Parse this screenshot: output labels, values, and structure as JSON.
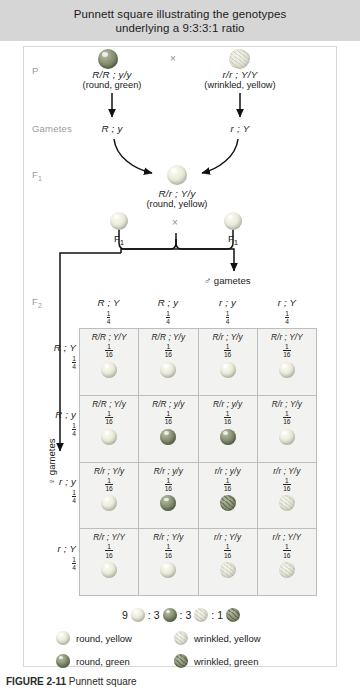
{
  "header": {
    "line1": "Punnett square illustrating the genotypes",
    "line2": "underlying a 9:3:3:1 ratio"
  },
  "generations": {
    "p_label": "P",
    "gametes_label": "Gametes",
    "f1_label": "F",
    "f1_sub": "1",
    "f2_label": "F",
    "f2_sub": "2"
  },
  "parents": {
    "left": {
      "genotype": "R/R ; y/y",
      "phenotype": "(round, green)",
      "gamete": "R ; y",
      "pea": "round-green"
    },
    "right": {
      "genotype": "r/r ; Y/Y",
      "phenotype": "(wrinkled, yellow)",
      "gamete": "r ; Y",
      "pea": "wrinkled-yellow"
    },
    "cross_symbol": "×"
  },
  "f1": {
    "genotype": "R/r ; Y/y",
    "phenotype": "(round, yellow)",
    "pea": "round-yellow",
    "left_label": "F",
    "left_sub": "1",
    "right_label": "F",
    "right_sub": "1",
    "cross_symbol": "×"
  },
  "punnett": {
    "male_gametes_label": "♂ gametes",
    "female_gametes_label": "♀ gametes",
    "columns": [
      {
        "gamete": "R ; Y",
        "freq_n": "1",
        "freq_d": "4"
      },
      {
        "gamete": "R ; y",
        "freq_n": "1",
        "freq_d": "4"
      },
      {
        "gamete": "r ; y",
        "freq_n": "1",
        "freq_d": "4"
      },
      {
        "gamete": "r ; Y",
        "freq_n": "1",
        "freq_d": "4"
      }
    ],
    "rows": [
      {
        "gamete": "R ; Y",
        "freq_n": "1",
        "freq_d": "4"
      },
      {
        "gamete": "R ; y",
        "freq_n": "1",
        "freq_d": "4"
      },
      {
        "gamete": "r ; y",
        "freq_n": "1",
        "freq_d": "4"
      },
      {
        "gamete": "r ; Y",
        "freq_n": "1",
        "freq_d": "4"
      }
    ],
    "cells": [
      {
        "genotype": "R/R ; Y/Y",
        "freq_n": "1",
        "freq_d": "16",
        "pea": "round-yellow"
      },
      {
        "genotype": "R/R ; Y/y",
        "freq_n": "1",
        "freq_d": "16",
        "pea": "round-yellow"
      },
      {
        "genotype": "R/r ; Y/y",
        "freq_n": "1",
        "freq_d": "16",
        "pea": "round-yellow"
      },
      {
        "genotype": "R/r ; Y/Y",
        "freq_n": "1",
        "freq_d": "16",
        "pea": "round-yellow"
      },
      {
        "genotype": "R/R ; Y/y",
        "freq_n": "1",
        "freq_d": "16",
        "pea": "round-yellow"
      },
      {
        "genotype": "R/R ; y/y",
        "freq_n": "1",
        "freq_d": "16",
        "pea": "round-green"
      },
      {
        "genotype": "R/r ; y/y",
        "freq_n": "1",
        "freq_d": "16",
        "pea": "round-green"
      },
      {
        "genotype": "R/r ; Y/y",
        "freq_n": "1",
        "freq_d": "16",
        "pea": "round-yellow"
      },
      {
        "genotype": "R/r ; Y/y",
        "freq_n": "1",
        "freq_d": "16",
        "pea": "round-yellow"
      },
      {
        "genotype": "R/r ; y/y",
        "freq_n": "1",
        "freq_d": "16",
        "pea": "round-green"
      },
      {
        "genotype": "r/r ; y/y",
        "freq_n": "1",
        "freq_d": "16",
        "pea": "wrinkled-green"
      },
      {
        "genotype": "r/r ; Y/y",
        "freq_n": "1",
        "freq_d": "16",
        "pea": "wrinkled-yellow"
      },
      {
        "genotype": "R/r ; Y/Y",
        "freq_n": "1",
        "freq_d": "16",
        "pea": "round-yellow"
      },
      {
        "genotype": "R/r ; Y/y",
        "freq_n": "1",
        "freq_d": "16",
        "pea": "round-yellow"
      },
      {
        "genotype": "r/r ; Y/y",
        "freq_n": "1",
        "freq_d": "16",
        "pea": "wrinkled-yellow"
      },
      {
        "genotype": "r/r ; Y/Y",
        "freq_n": "1",
        "freq_d": "16",
        "pea": "wrinkled-yellow"
      }
    ]
  },
  "ratio": {
    "parts": [
      {
        "count": "9",
        "pea": "round-yellow"
      },
      {
        "count": "3",
        "pea": "round-green"
      },
      {
        "count": "3",
        "pea": "wrinkled-yellow"
      },
      {
        "count": "1",
        "pea": "wrinkled-green"
      }
    ],
    "separator": ":"
  },
  "legend": [
    {
      "label": "round, yellow",
      "pea": "round-yellow"
    },
    {
      "label": "wrinkled, yellow",
      "pea": "wrinkled-yellow"
    },
    {
      "label": "round, green",
      "pea": "round-green"
    },
    {
      "label": "wrinkled, green",
      "pea": "wrinkled-green"
    }
  ],
  "caption": {
    "prefix": "FIGURE 2-11",
    "text": "Punnett square"
  }
}
